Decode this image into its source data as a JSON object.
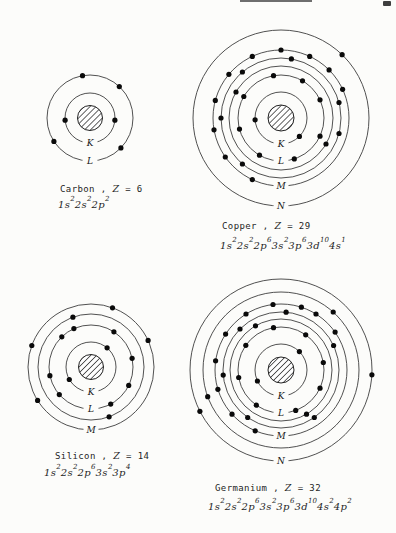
{
  "figure": {
    "background": "#fcfcfa",
    "ring_color": "#3d3d3d",
    "dot_color": "#0a0a0a",
    "nucleus_stroke": "#222222",
    "label_color": "#141414"
  },
  "artifacts": {
    "top_rule": {
      "x": 240,
      "y": 0,
      "w": 72,
      "h": 2
    },
    "corner_mark": {
      "x": 383,
      "y": 1,
      "w": 8,
      "h": 5
    }
  },
  "atoms": [
    {
      "id": "carbon",
      "caption": {
        "name": "Carbon",
        "sep": " , ",
        "symbol": "Z",
        "value": " = 6"
      },
      "formula": [
        [
          "1s",
          "2"
        ],
        [
          "2s",
          "2"
        ],
        [
          "2p",
          "2"
        ]
      ],
      "center": {
        "x": 90,
        "y": 118
      },
      "nucleus_radius": 12.5,
      "caption_pos": {
        "x": 60,
        "y": 183
      },
      "formula_pos": {
        "x": 58,
        "y": 198
      },
      "rings": [
        {
          "r": 25,
          "label": "K",
          "electrons": [
            185,
            355
          ]
        },
        {
          "r": 43,
          "label": "L",
          "electrons": [
            100,
            47,
            213,
            316
          ]
        }
      ]
    },
    {
      "id": "copper",
      "caption": {
        "name": "Copper",
        "sep": " , ",
        "symbol": "Z",
        "value": " = 29"
      },
      "formula": [
        [
          "1s",
          "2"
        ],
        [
          "2s",
          "2"
        ],
        [
          "2p",
          "6"
        ],
        [
          "3s",
          "2"
        ],
        [
          "3p",
          "6"
        ],
        [
          "3d",
          "10"
        ],
        [
          "4s",
          "1"
        ]
      ],
      "center": {
        "x": 281,
        "y": 118
      },
      "nucleus_radius": 13,
      "caption_pos": {
        "x": 222,
        "y": 220
      },
      "formula_pos": {
        "x": 220,
        "y": 239
      },
      "rings": [
        {
          "r": 26,
          "label": "K",
          "electrons": [
            184,
            315
          ]
        },
        {
          "r": 43,
          "label": "L",
          "electrons": [
            100,
            60,
            25,
            150,
            195,
            240,
            288,
            335
          ]
        },
        {
          "r": 52,
          "label": null,
          "electrons": [
            150,
            330
          ]
        },
        {
          "r": 60,
          "label": null,
          "electrons": [
            80,
            130,
            180,
            230,
            345,
            15
          ]
        },
        {
          "r": 68,
          "label": "M",
          "electrons": [
            65,
            90,
            115,
            140,
            165,
            190,
            215,
            245,
            25,
            45
          ]
        },
        {
          "r": 88,
          "label": "N",
          "electrons": [
            46
          ]
        }
      ]
    },
    {
      "id": "silicon",
      "caption": {
        "name": "Silicon",
        "sep": " , ",
        "symbol": "Z",
        "value": " = 14"
      },
      "formula": [
        [
          "1s",
          "2"
        ],
        [
          "2s",
          "2"
        ],
        [
          "2p",
          "6"
        ],
        [
          "3s",
          "2"
        ],
        [
          "3p",
          "4"
        ]
      ],
      "center": {
        "x": 91,
        "y": 367
      },
      "nucleus_radius": 12.5,
      "caption_pos": {
        "x": 55,
        "y": 450
      },
      "formula_pos": {
        "x": 44,
        "y": 466
      },
      "rings": [
        {
          "r": 25,
          "label": "K",
          "electrons": [
            50,
            210
          ]
        },
        {
          "r": 42,
          "label": "L",
          "electrons": [
            134,
            114,
            57,
            12,
            192,
            221,
            298,
            334
          ]
        },
        {
          "r": 53,
          "label": null,
          "electrons": [
            110,
            290
          ]
        },
        {
          "r": 63,
          "label": "M",
          "electrons": [
            70,
            25,
            160,
            212
          ]
        }
      ]
    },
    {
      "id": "germanium",
      "caption": {
        "name": "Germanium",
        "sep": " , ",
        "symbol": "Z",
        "value": " = 32"
      },
      "formula": [
        [
          "1s",
          "2"
        ],
        [
          "2s",
          "2"
        ],
        [
          "2p",
          "6"
        ],
        [
          "3s",
          "2"
        ],
        [
          "3p",
          "6"
        ],
        [
          "3d",
          "10"
        ],
        [
          "4s",
          "2"
        ],
        [
          "4p",
          "2"
        ]
      ],
      "center": {
        "x": 281,
        "y": 370
      },
      "nucleus_radius": 13,
      "caption_pos": {
        "x": 215,
        "y": 482
      },
      "formula_pos": {
        "x": 208,
        "y": 500
      },
      "rings": [
        {
          "r": 26,
          "label": "K",
          "electrons": [
            205,
            45
          ]
        },
        {
          "r": 43,
          "label": "L",
          "electrons": [
            100,
            55,
            10,
            145,
            190,
            235,
            290,
            335
          ]
        },
        {
          "r": 51,
          "label": null,
          "electrons": [
            120,
            300
          ]
        },
        {
          "r": 58,
          "label": null,
          "electrons": [
            85,
            135,
            185,
            235,
            305,
            25
          ]
        },
        {
          "r": 66,
          "label": "M",
          "electrons": [
            72,
            97,
            122,
            147,
            172,
            197,
            222,
            247,
            35,
            58
          ]
        },
        {
          "r": 78,
          "label": null,
          "electrons": [
            48,
            200
          ]
        },
        {
          "r": 91,
          "label": "N",
          "electrons": [
            357,
            207
          ]
        }
      ]
    }
  ]
}
